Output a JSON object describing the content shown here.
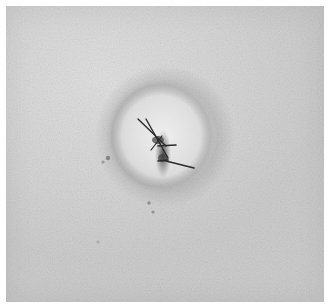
{
  "image": {
    "description": "Grayscale close-up photograph of skin with a small sutured wound surrounded by a pale halo",
    "subject": "sutured-skin-wound",
    "colors": {
      "skin": "#d2d2d2",
      "halo": "#e6e6e6",
      "halo_rim": "#a8a8a8",
      "suture": "#2e2e2e",
      "wound": "#4a4a4a"
    }
  }
}
